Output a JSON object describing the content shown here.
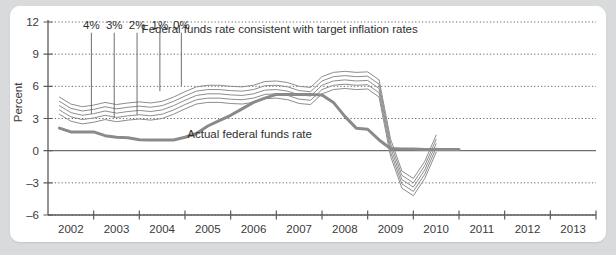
{
  "chart_data": {
    "type": "line",
    "title": "Federal funds rate consistent with target inflation rates",
    "xlabel": "",
    "ylabel": "Percent",
    "xlim": [
      2001.5,
      2013.5
    ],
    "ylim": [
      -6,
      12
    ],
    "yticks": [
      12,
      9,
      6,
      3,
      0,
      -3,
      -6
    ],
    "ytick_labels": [
      "12",
      "9",
      "6",
      "3",
      "0",
      "–3",
      "–6"
    ],
    "xticks": [
      2002,
      2003,
      2004,
      2005,
      2006,
      2007,
      2008,
      2009,
      2010,
      2011,
      2012,
      2013
    ],
    "xtick_labels": [
      "2002",
      "2003",
      "2004",
      "2005",
      "2006",
      "2007",
      "2008",
      "2009",
      "2010",
      "2011",
      "2012",
      "2013"
    ],
    "grid": "horizontal-dotted",
    "legend_position": "inline-annotations",
    "annotations": [
      {
        "name": "actual-rate-label",
        "text": "Actual federal funds rate",
        "x": 2004.55,
        "y": 1.15
      },
      {
        "name": "target-rates-title",
        "text": "Federal funds rate consistent with target inflation rates",
        "x": 2003.55,
        "y": 11.0
      }
    ],
    "callouts": [
      {
        "label": "4%",
        "x": 2002.45,
        "y_top": 11.0,
        "y_bottom": 3.45
      },
      {
        "label": "3%",
        "x": 2002.95,
        "y_top": 11.0,
        "y_bottom": 3.05
      },
      {
        "label": "2%",
        "x": 2003.45,
        "y_top": 11.0,
        "y_bottom": 3.35
      },
      {
        "label": "1%",
        "x": 2003.95,
        "y_top": 11.0,
        "y_bottom": 5.55
      },
      {
        "label": "0%",
        "x": 2004.42,
        "y_top": 11.0,
        "y_bottom": 6.05
      }
    ],
    "series": [
      {
        "name": "Actual federal funds rate",
        "style": "thick",
        "color": "#8a8a8a",
        "x": [
          2001.75,
          2002.0,
          2002.25,
          2002.5,
          2002.75,
          2003.0,
          2003.25,
          2003.5,
          2003.75,
          2004.0,
          2004.25,
          2004.5,
          2004.75,
          2005.0,
          2005.25,
          2005.5,
          2005.75,
          2006.0,
          2006.25,
          2006.5,
          2006.75,
          2007.0,
          2007.25,
          2007.5,
          2007.75,
          2008.0,
          2008.25,
          2008.5,
          2008.75,
          2009.0,
          2009.25,
          2009.5,
          2009.75,
          2010.0,
          2010.25,
          2010.5
        ],
        "values": [
          2.1,
          1.75,
          1.75,
          1.75,
          1.4,
          1.25,
          1.2,
          1.02,
          1.0,
          1.0,
          1.0,
          1.25,
          1.6,
          2.3,
          2.8,
          3.3,
          3.9,
          4.5,
          4.9,
          5.25,
          5.25,
          5.25,
          5.25,
          5.2,
          4.5,
          3.2,
          2.1,
          2.0,
          1.0,
          0.2,
          0.15,
          0.15,
          0.12,
          0.12,
          0.12,
          0.12
        ]
      },
      {
        "name": "Taylor rule, 0% target inflation",
        "style": "thin",
        "color": "#8d8d8d",
        "x": [
          2001.75,
          2002.0,
          2002.25,
          2002.5,
          2002.75,
          2003.0,
          2003.25,
          2003.5,
          2003.75,
          2004.0,
          2004.25,
          2004.5,
          2004.75,
          2005.0,
          2005.25,
          2005.5,
          2005.75,
          2006.0,
          2006.25,
          2006.5,
          2006.75,
          2007.0,
          2007.25,
          2007.5,
          2007.75,
          2008.0,
          2008.25,
          2008.5,
          2008.75,
          2009.0,
          2009.25,
          2009.5,
          2009.75,
          2010.0
        ],
        "values": [
          5.0,
          4.35,
          4.1,
          4.25,
          4.5,
          4.3,
          4.45,
          4.55,
          4.45,
          4.6,
          5.0,
          5.5,
          5.95,
          6.1,
          6.1,
          6.0,
          5.95,
          6.1,
          6.45,
          6.5,
          6.35,
          6.0,
          5.9,
          6.9,
          7.3,
          7.4,
          7.3,
          7.35,
          6.6,
          1.1,
          -1.9,
          -2.6,
          -1.0,
          1.45
        ]
      },
      {
        "name": "Taylor rule, 1% target inflation",
        "style": "thin",
        "color": "#8d8d8d",
        "x": [
          2001.75,
          2002.0,
          2002.25,
          2002.5,
          2002.75,
          2003.0,
          2003.25,
          2003.5,
          2003.75,
          2004.0,
          2004.25,
          2004.5,
          2004.75,
          2005.0,
          2005.25,
          2005.5,
          2005.75,
          2006.0,
          2006.25,
          2006.5,
          2006.75,
          2007.0,
          2007.25,
          2007.5,
          2007.75,
          2008.0,
          2008.25,
          2008.5,
          2008.75,
          2009.0,
          2009.25,
          2009.5,
          2009.75,
          2010.0
        ],
        "values": [
          4.6,
          3.95,
          3.7,
          3.85,
          4.1,
          3.9,
          4.05,
          4.15,
          4.05,
          4.2,
          4.6,
          5.1,
          5.55,
          5.7,
          5.7,
          5.6,
          5.55,
          5.7,
          6.05,
          6.1,
          5.95,
          5.6,
          5.5,
          6.5,
          6.9,
          7.0,
          6.9,
          6.95,
          6.2,
          0.7,
          -2.3,
          -3.0,
          -1.4,
          1.05
        ]
      },
      {
        "name": "Taylor rule, 2% target inflation",
        "style": "thin",
        "color": "#8d8d8d",
        "x": [
          2001.75,
          2002.0,
          2002.25,
          2002.5,
          2002.75,
          2003.0,
          2003.25,
          2003.5,
          2003.75,
          2004.0,
          2004.25,
          2004.5,
          2004.75,
          2005.0,
          2005.25,
          2005.5,
          2005.75,
          2006.0,
          2006.25,
          2006.5,
          2006.75,
          2007.0,
          2007.25,
          2007.5,
          2007.75,
          2008.0,
          2008.25,
          2008.5,
          2008.75,
          2009.0,
          2009.25,
          2009.5,
          2009.75,
          2010.0
        ],
        "values": [
          4.2,
          3.55,
          3.3,
          3.45,
          3.7,
          3.5,
          3.65,
          3.75,
          3.65,
          3.8,
          4.2,
          4.7,
          5.15,
          5.3,
          5.3,
          5.2,
          5.15,
          5.3,
          5.65,
          5.7,
          5.55,
          5.2,
          5.1,
          6.1,
          6.5,
          6.6,
          6.5,
          6.55,
          5.8,
          0.3,
          -2.7,
          -3.4,
          -1.8,
          0.65
        ]
      },
      {
        "name": "Taylor rule, 3% target inflation",
        "style": "thin",
        "color": "#8d8d8d",
        "x": [
          2001.75,
          2002.0,
          2002.25,
          2002.5,
          2002.75,
          2003.0,
          2003.25,
          2003.5,
          2003.75,
          2004.0,
          2004.25,
          2004.5,
          2004.75,
          2005.0,
          2005.25,
          2005.5,
          2005.75,
          2006.0,
          2006.25,
          2006.5,
          2006.75,
          2007.0,
          2007.25,
          2007.5,
          2007.75,
          2008.0,
          2008.25,
          2008.5,
          2008.75,
          2009.0,
          2009.25,
          2009.5,
          2009.75,
          2010.0
        ],
        "values": [
          3.8,
          3.15,
          2.9,
          3.05,
          3.3,
          3.1,
          3.25,
          3.35,
          3.25,
          3.4,
          3.8,
          4.3,
          4.75,
          4.9,
          4.9,
          4.8,
          4.75,
          4.9,
          5.25,
          5.3,
          5.15,
          4.8,
          4.7,
          5.7,
          6.1,
          6.2,
          6.1,
          6.15,
          5.4,
          -0.1,
          -3.1,
          -3.8,
          -2.2,
          0.25
        ]
      },
      {
        "name": "Taylor rule, 4% target inflation",
        "style": "thin",
        "color": "#8d8d8d",
        "x": [
          2001.75,
          2002.0,
          2002.25,
          2002.5,
          2002.75,
          2003.0,
          2003.25,
          2003.5,
          2003.75,
          2004.0,
          2004.25,
          2004.5,
          2004.75,
          2005.0,
          2005.25,
          2005.5,
          2005.75,
          2006.0,
          2006.25,
          2006.5,
          2006.75,
          2007.0,
          2007.25,
          2007.5,
          2007.75,
          2008.0,
          2008.25,
          2008.5,
          2008.75,
          2009.0,
          2009.25,
          2009.5,
          2009.75,
          2010.0
        ],
        "values": [
          3.4,
          2.75,
          2.5,
          2.65,
          2.9,
          2.7,
          2.85,
          2.95,
          2.85,
          3.0,
          3.4,
          3.9,
          4.35,
          4.5,
          4.5,
          4.4,
          4.35,
          4.5,
          4.85,
          4.9,
          4.75,
          4.4,
          4.3,
          5.3,
          5.7,
          5.8,
          5.7,
          5.75,
          5.0,
          -0.5,
          -3.5,
          -4.2,
          -2.6,
          -0.15
        ]
      }
    ]
  }
}
